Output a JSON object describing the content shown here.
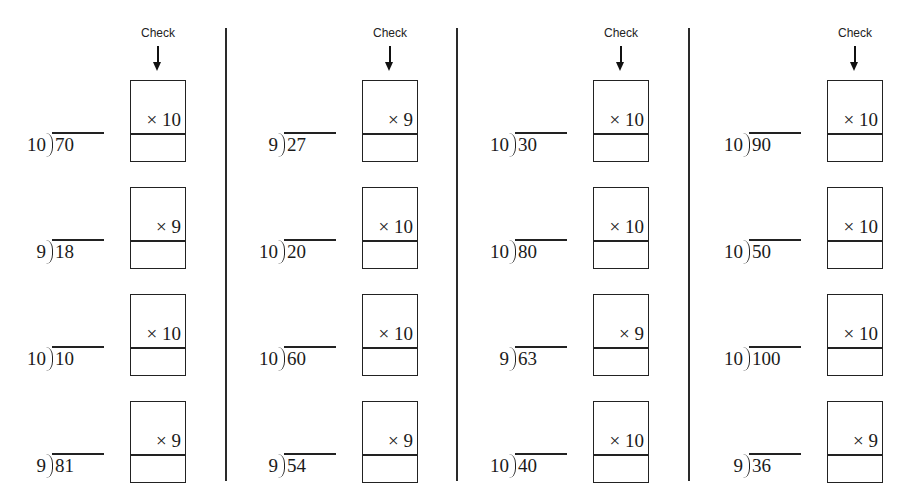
{
  "worksheet": {
    "check_label": "Check",
    "columns": [
      {
        "problems": [
          {
            "divisor": "10",
            "dividend": "70",
            "multiplier": "× 10",
            "answer": ""
          },
          {
            "divisor": "9",
            "dividend": "18",
            "multiplier": "× 9",
            "answer": ""
          },
          {
            "divisor": "10",
            "dividend": "10",
            "multiplier": "× 10",
            "answer": ""
          },
          {
            "divisor": "9",
            "dividend": "81",
            "multiplier": "× 9",
            "answer": ""
          }
        ]
      },
      {
        "problems": [
          {
            "divisor": "9",
            "dividend": "27",
            "multiplier": "× 9",
            "answer": ""
          },
          {
            "divisor": "10",
            "dividend": "20",
            "multiplier": "× 10",
            "answer": ""
          },
          {
            "divisor": "10",
            "dividend": "60",
            "multiplier": "× 10",
            "answer": ""
          },
          {
            "divisor": "9",
            "dividend": "54",
            "multiplier": "× 9",
            "answer": ""
          }
        ]
      },
      {
        "problems": [
          {
            "divisor": "10",
            "dividend": "30",
            "multiplier": "× 10",
            "answer": ""
          },
          {
            "divisor": "10",
            "dividend": "80",
            "multiplier": "× 10",
            "answer": ""
          },
          {
            "divisor": "9",
            "dividend": "63",
            "multiplier": "× 9",
            "answer": ""
          },
          {
            "divisor": "10",
            "dividend": "40",
            "multiplier": "× 10",
            "answer": ""
          }
        ]
      },
      {
        "problems": [
          {
            "divisor": "10",
            "dividend": "90",
            "multiplier": "× 10",
            "answer": ""
          },
          {
            "divisor": "10",
            "dividend": "50",
            "multiplier": "× 10",
            "answer": ""
          },
          {
            "divisor": "10",
            "dividend": "100",
            "multiplier": "× 10",
            "answer": ""
          },
          {
            "divisor": "9",
            "dividend": "36",
            "multiplier": "× 9",
            "answer": ""
          }
        ]
      }
    ]
  }
}
